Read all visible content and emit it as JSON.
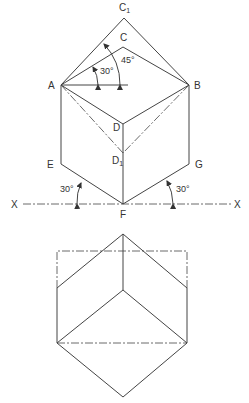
{
  "labels": {
    "c1": "C",
    "c1_sub": "1",
    "c": "C",
    "a": "A",
    "b": "B",
    "d": "D",
    "d1": "D",
    "d1_sub": "1",
    "e": "E",
    "g": "G",
    "f": "F",
    "x_left": "X",
    "x_right": "X"
  },
  "angles": {
    "top_small": "30°",
    "top_large": "45°",
    "bottom_left": "30°",
    "bottom_right": "30°"
  },
  "colors": {
    "line": "#444444",
    "text": "#333333",
    "background": "#ffffff"
  }
}
